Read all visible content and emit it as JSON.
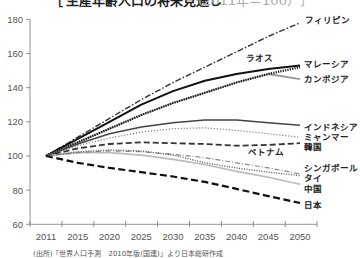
{
  "title": {
    "open_bracket": "［",
    "main": "生産年齢人口の将来見通し",
    "sub": "（2011年＝100）",
    "close_bracket": "］"
  },
  "source_note": "(出所)「世界人口予測　2010年版(国連)」より日本総研作成",
  "chart_data": {
    "type": "line",
    "xlabel": "",
    "ylabel": "",
    "categories": [
      "2011",
      "2015",
      "2020",
      "2025",
      "2030",
      "2035",
      "2040",
      "2045",
      "2050"
    ],
    "yticks": [
      180,
      160,
      140,
      120,
      100,
      80,
      60
    ],
    "ylim": [
      60,
      180
    ],
    "grid": false,
    "legend_position": "inline-right",
    "series": [
      {
        "name": "フィリピン",
        "values": [
          100,
          111,
          122,
          133,
          143,
          152,
          161,
          170,
          178
        ],
        "color": "#333333",
        "dash": "6 2 1.5 2",
        "width": 1.4
      },
      {
        "name": "ラオス",
        "values": [
          100,
          110,
          120,
          130,
          138,
          144,
          148,
          151,
          153
        ],
        "color": "#111111",
        "dash": "",
        "width": 2
      },
      {
        "name": "カンボジア",
        "values": [
          100,
          108,
          116,
          124,
          131,
          137,
          143,
          148,
          145
        ],
        "color": "#999999",
        "dash": "",
        "width": 1.8
      },
      {
        "name": "マレーシア",
        "values": [
          100,
          108,
          116,
          124,
          131,
          137,
          143,
          148,
          152
        ],
        "color": "#111111",
        "dash": "1.2 1.2",
        "width": 2.2
      },
      {
        "name": "インドネシア",
        "values": [
          100,
          107,
          113,
          117,
          119.5,
          121,
          121,
          119.5,
          118
        ],
        "color": "#444444",
        "dash": "",
        "width": 1.5
      },
      {
        "name": "ミャンマー",
        "values": [
          100,
          106,
          110.5,
          114,
          116,
          116.5,
          115,
          113,
          111
        ],
        "color": "#666666",
        "dash": "1 2",
        "width": 1.2
      },
      {
        "name": "韓国",
        "values": [
          100,
          104.5,
          107,
          108,
          107.5,
          107,
          106,
          106.5,
          107.5
        ],
        "color": "#333333",
        "dash": "6 3",
        "width": 1.8
      },
      {
        "name": "中国",
        "values": [
          100,
          102,
          102,
          100.5,
          98,
          95,
          91,
          87.5,
          83.5
        ],
        "color": "#bbbbbb",
        "dash": "",
        "width": 1.6
      },
      {
        "name": "シンガポール",
        "values": [
          100,
          102,
          103,
          102.5,
          101,
          99,
          96,
          93,
          89.5
        ],
        "color": "#888888",
        "dash": "5 2 1 2",
        "width": 1.2
      },
      {
        "name": "タイ",
        "values": [
          100,
          102.5,
          103.5,
          103,
          100.5,
          96,
          93,
          90.5,
          88.5
        ],
        "color": "#555555",
        "dash": "1 1.5",
        "width": 1.4
      },
      {
        "name": "日本",
        "values": [
          100,
          96,
          93,
          90.5,
          88,
          84.8,
          80.7,
          76.5,
          72.5
        ],
        "color": "#111111",
        "dash": "7 3.5",
        "width": 2.2
      }
    ],
    "labels": [
      {
        "text": "フィリピン",
        "x": 305,
        "y": 23
      },
      {
        "text": "ラオス",
        "x": 246,
        "y": 61
      },
      {
        "text": "マレーシア",
        "x": 304,
        "y": 67
      },
      {
        "text": "カンボジア",
        "x": 304,
        "y": 82
      },
      {
        "text": "インドネシア",
        "x": 304,
        "y": 130
      },
      {
        "text": "ミャンマー",
        "x": 304,
        "y": 140
      },
      {
        "text": "韓国",
        "x": 304,
        "y": 150
      },
      {
        "text": "ベトナム",
        "x": 248,
        "y": 155
      },
      {
        "text": "シンガポール",
        "x": 304,
        "y": 171
      },
      {
        "text": "タイ",
        "x": 304,
        "y": 181
      },
      {
        "text": "中国",
        "x": 304,
        "y": 192
      },
      {
        "text": "日本",
        "x": 304,
        "y": 208
      }
    ]
  }
}
